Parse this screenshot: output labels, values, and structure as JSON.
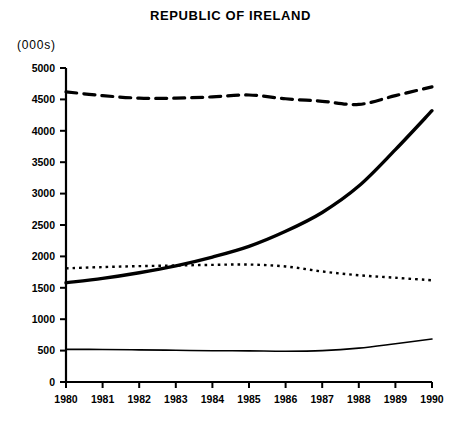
{
  "chart_data": {
    "type": "line",
    "title": "REPUBLIC OF IRELAND",
    "unit_label": "(000s)",
    "xlabel": "",
    "ylabel": "",
    "categories": [
      "1980",
      "1981",
      "1982",
      "1983",
      "1984",
      "1985",
      "1986",
      "1987",
      "1988",
      "1989",
      "1990"
    ],
    "x": [
      1980,
      1981,
      1982,
      1983,
      1984,
      1985,
      1986,
      1987,
      1988,
      1989,
      1990
    ],
    "xlim": [
      1980,
      1990
    ],
    "ylim": [
      0,
      5000
    ],
    "yticks": [
      0,
      500,
      1000,
      1500,
      2000,
      2500,
      3000,
      3500,
      4000,
      4500,
      5000
    ],
    "ytick_labels": [
      "0",
      "500",
      "1000",
      "1500",
      "2000",
      "2500",
      "3000",
      "3500",
      "4000",
      "4500",
      "5000"
    ],
    "grid": false,
    "legend": "none",
    "series": [
      {
        "name": "series-dashed-top",
        "style": "dashed",
        "linewidth": 3.2,
        "values": [
          4620,
          4560,
          4520,
          4520,
          4540,
          4570,
          4510,
          4470,
          4420,
          4560,
          4700
        ]
      },
      {
        "name": "series-thick-rising",
        "style": "solid-thick",
        "linewidth": 3.4,
        "values": [
          1580,
          1650,
          1740,
          1850,
          1990,
          2160,
          2400,
          2700,
          3120,
          3700,
          4320
        ]
      },
      {
        "name": "series-dotted-middle",
        "style": "dotted",
        "linewidth": 2.4,
        "values": [
          1810,
          1830,
          1845,
          1855,
          1865,
          1870,
          1840,
          1760,
          1700,
          1660,
          1620
        ]
      },
      {
        "name": "series-thin-bottom",
        "style": "solid-thin",
        "linewidth": 1.6,
        "values": [
          520,
          518,
          512,
          505,
          498,
          496,
          490,
          500,
          540,
          610,
          685
        ]
      }
    ]
  }
}
